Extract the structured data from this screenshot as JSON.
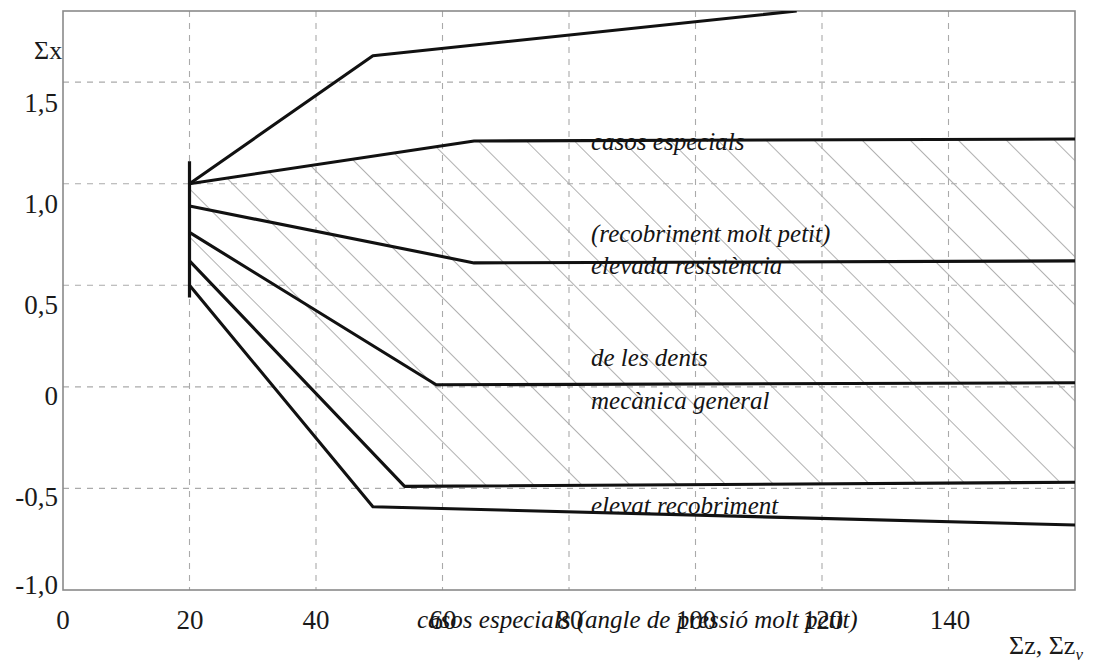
{
  "axes": {
    "y_title": "Σx",
    "x_title_main": "Σz,",
    "x_title_second": "Σz",
    "x_title_sub": "v"
  },
  "chart_data": {
    "type": "line",
    "title": "",
    "xlabel": "Σz, Σzv",
    "ylabel": "Σx",
    "xlim": [
      0,
      160
    ],
    "ylim": [
      -1.0,
      1.85
    ],
    "grid": true,
    "legend": "none",
    "x_ticks": [
      0,
      20,
      40,
      60,
      80,
      100,
      120,
      140
    ],
    "x_tick_labels": [
      "0",
      "20",
      "40",
      "60",
      "80",
      "100",
      "120",
      "140"
    ],
    "y_ticks": [
      -1.0,
      -0.5,
      0,
      0.5,
      1.0,
      1.5
    ],
    "y_tick_labels": [
      "-1,0",
      "-0,5",
      "0",
      "0,5",
      "1,0",
      "1,5"
    ],
    "series": [
      {
        "name": "boundary-1-upper-special-cases",
        "points": [
          [
            20,
            1.0
          ],
          [
            49,
            1.63
          ],
          [
            116,
            1.85
          ]
        ]
      },
      {
        "name": "boundary-2-tooth-strength-upper",
        "points": [
          [
            20,
            1.0
          ],
          [
            65,
            1.21
          ],
          [
            160,
            1.22
          ]
        ]
      },
      {
        "name": "boundary-3-tooth-strength-lower",
        "points": [
          [
            20,
            0.89
          ],
          [
            65,
            0.61
          ],
          [
            160,
            0.62
          ]
        ]
      },
      {
        "name": "boundary-4-general-mechanics-lower",
        "points": [
          [
            20,
            0.76
          ],
          [
            59,
            0.01
          ],
          [
            160,
            0.02
          ]
        ]
      },
      {
        "name": "boundary-5-high-overlap-lower",
        "points": [
          [
            20,
            0.62
          ],
          [
            54,
            -0.49
          ],
          [
            160,
            -0.47
          ]
        ]
      },
      {
        "name": "boundary-6-lower-special-cases",
        "points": [
          [
            20,
            0.5
          ],
          [
            49,
            -0.59
          ],
          [
            160,
            -0.68
          ]
        ]
      }
    ],
    "hatched_bands": [
      {
        "name": "elevada-resistencia-de-les-dents",
        "upper": 1,
        "lower": 2
      },
      {
        "name": "mecanica-general",
        "upper": 2,
        "lower": 3
      },
      {
        "name": "elevat-recobriment",
        "upper": 3,
        "lower": 4
      }
    ],
    "annotations": [
      {
        "name": "casos-especials-recobriment-molt-petit",
        "lines": [
          "casos especials",
          "(recobriment molt petit)"
        ],
        "x": 83,
        "y": 1.53
      },
      {
        "name": "elevada-resistencia-de-les-dents",
        "lines": [
          "elevada resistència",
          "de les dents"
        ],
        "x": 83,
        "y": 0.97
      },
      {
        "name": "mecanica-general",
        "lines": [
          "mecànica general"
        ],
        "x": 83,
        "y": 0.27
      },
      {
        "name": "elevat-recobriment",
        "lines": [
          "elevat recobriment"
        ],
        "x": 83,
        "y": -0.23
      },
      {
        "name": "casos-especials-angle-de-pressio-molt-petit",
        "lines": [
          "casos especials (angle de pressió molt petit)"
        ],
        "x": 55,
        "y": -0.8
      }
    ],
    "colors": {
      "curve": "#111111",
      "frame": "#8a8a8a",
      "grid": "#aaaaaa",
      "hatch": "#8f8f8f",
      "text": "#141414",
      "background": "#ffffff"
    }
  },
  "labels": {
    "region_1_line_1": "casos especials",
    "region_1_line_2": "(recobriment molt petit)",
    "region_2_line_1": "elevada resistència",
    "region_2_line_2": "de les dents",
    "region_3_line_1": "mecànica general",
    "region_4_line_1": "elevat recobriment",
    "region_5_line_1": "casos especials (angle de pressió molt petit)"
  },
  "ticks": {
    "y": {
      "t15": "1,5",
      "t10": "1,0",
      "t05": "0,5",
      "t00": "0",
      "tm05": "-0,5",
      "tm10": "-1,0"
    },
    "x": {
      "t0": "0",
      "t20": "20",
      "t40": "40",
      "t60": "60",
      "t80": "80",
      "t100": "100",
      "t120": "120",
      "t140": "140"
    }
  }
}
